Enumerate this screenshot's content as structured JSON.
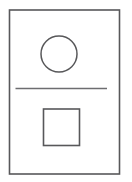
{
  "figure": {
    "title": "",
    "background_color": "#ffffff",
    "width": 132,
    "height": 182,
    "stroke_color": "#58585a",
    "divider_color": "#6d6d70",
    "fill": "none"
  },
  "shapes": {
    "frame": {
      "name": "outer rectangle",
      "type": "rect",
      "x": 9.5,
      "y": 10.0,
      "width": 110.0,
      "height": 164.0,
      "stroke_width": 1.6,
      "fill": "none"
    },
    "circle": {
      "name": "circle",
      "type": "circle",
      "cx": 59.0,
      "cy": 54.0,
      "r": 18.0,
      "stroke_width": 1.5,
      "fill": "none"
    },
    "divider": {
      "name": "horizontal line",
      "type": "line",
      "x1": 15.5,
      "y1": 88.5,
      "x2": 107.0,
      "y2": 88.5,
      "stroke_width": 1.7
    },
    "square": {
      "name": "square",
      "type": "rect",
      "x": 43.5,
      "y": 109.0,
      "width": 36.0,
      "height": 36.5,
      "stroke_width": 1.6,
      "fill": "none"
    }
  }
}
